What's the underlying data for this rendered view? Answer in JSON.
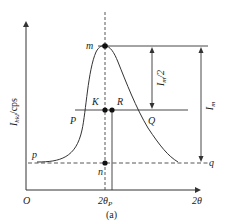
{
  "figure": {
    "caption": "(a)",
    "y_axis_label": "I_hkl/cps",
    "y_axis_label_main": "I",
    "y_axis_label_sub": "hkl",
    "y_axis_label_unit": "/cps",
    "x_axis_label": "2θ",
    "origin_label": "O",
    "peak_position_label": "2θ",
    "peak_position_sub": "P",
    "points": {
      "m": "m",
      "K": "K",
      "R": "R",
      "P": "P",
      "Q": "Q",
      "p": "p",
      "q": "q",
      "n": "n"
    },
    "annotations": {
      "half_max": "I",
      "half_max_sub": "m",
      "half_max_suffix": "/2",
      "max": "I",
      "max_sub": "m"
    },
    "colors": {
      "line": "#333333",
      "dot": "#111111",
      "background": "#ffffff"
    }
  }
}
